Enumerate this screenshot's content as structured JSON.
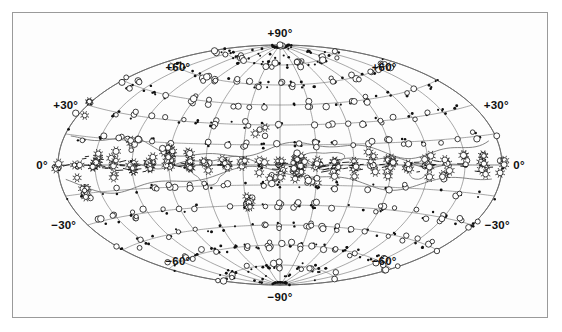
{
  "figure": {
    "name": "all-sky-aitoff-map",
    "kind": "astronomical-all-sky-projection",
    "projection": "Aitoff equal-area (Hammer-Aitoff) oval all-sky projection",
    "frame_color": "#9a9a9a",
    "background_color": "#fdfdfd",
    "grid_color": "#6d6d6d",
    "marker_color": "#111111"
  },
  "labels": {
    "dec_plus_90": "+90°",
    "dec_plus_60_left": "+60°",
    "dec_plus_60_right": "+60°",
    "dec_plus_30_left": "+30°",
    "dec_plus_30_right": "+30°",
    "dec_zero_left": "0°",
    "dec_zero_right": "0°",
    "dec_minus_30_left": "−30°",
    "dec_minus_30_right": "−30°",
    "dec_minus_60_left": "−60°",
    "dec_minus_60_right": "−60°",
    "dec_minus_90": "−90°"
  },
  "chart_data": {
    "type": "scatter",
    "title": "",
    "xlabel": "",
    "ylabel": "",
    "projection": "aitoff",
    "grid": true,
    "legend_position": "none",
    "xlim": [
      -180,
      180
    ],
    "ylim": [
      -90,
      90
    ],
    "graticule": {
      "parallels_deg": [
        -75,
        -60,
        -45,
        -30,
        -15,
        0,
        15,
        30,
        45,
        60,
        75
      ],
      "labeled_parallels_deg": [
        -90,
        -60,
        -30,
        0,
        30,
        60,
        90
      ],
      "meridians_deg": [
        -180,
        -150,
        -120,
        -90,
        -60,
        -30,
        0,
        30,
        60,
        90,
        120,
        150,
        180
      ],
      "meridian_step_deg": 15,
      "parallel_step_deg": 15
    },
    "marker_types": [
      {
        "name": "filled-dot",
        "symbol": "●",
        "meaning": "small / faint source"
      },
      {
        "name": "open-circle",
        "symbol": "○",
        "meaning": "medium source"
      },
      {
        "name": "starburst-circle",
        "symbol": "✳",
        "meaning": "large / bright source"
      },
      {
        "name": "dash",
        "symbol": "—",
        "meaning": "elongated / extended source"
      }
    ],
    "series": [
      {
        "name": "filled-dot",
        "marker": "filled-dot",
        "count": 470,
        "note": "dense along meridian/parallel intersections over full sky"
      },
      {
        "name": "open-circle",
        "marker": "open-circle",
        "count": 300,
        "note": "concentrated toward mid and low latitudes"
      },
      {
        "name": "starburst-circle",
        "marker": "starburst-circle",
        "count": 120,
        "note": "strongly concentrated within +/-20 deg of equator"
      },
      {
        "name": "dash",
        "marker": "dash",
        "count": 80,
        "note": "clustered along the equatorial band"
      }
    ],
    "overlay_contours": {
      "name": "equatorial-band-outline",
      "count": 3,
      "note": "irregular closed curves tracing the dense equatorial structure"
    }
  }
}
